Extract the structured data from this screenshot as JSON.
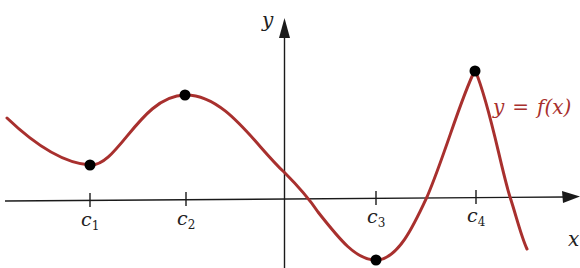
{
  "diagram": {
    "type": "function-graph",
    "axes": {
      "x_label": "x",
      "y_label": "y"
    },
    "function_label": "y = f(x)",
    "function_label_parts": {
      "y": "y",
      "eq": "=",
      "f": "f(x)"
    },
    "colors": {
      "curve": "#a8302e",
      "axis": "#1a1a1a",
      "points": "#000000",
      "function_label": "#a8302e"
    },
    "ticks": [
      {
        "name": "c",
        "sub": "1",
        "x": 90
      },
      {
        "name": "c",
        "sub": "2",
        "x": 186
      },
      {
        "name": "c",
        "sub": "3",
        "x": 376
      },
      {
        "name": "c",
        "sub": "4",
        "x": 476
      }
    ],
    "marked_points": [
      {
        "label": "(c1, f(c1))",
        "kind": "local minimum",
        "px": [
          90,
          165
        ]
      },
      {
        "label": "(c2, f(c2))",
        "kind": "local maximum",
        "px": [
          185,
          95
        ]
      },
      {
        "label": "(c3, f(c3))",
        "kind": "local minimum",
        "px": [
          376,
          260
        ]
      },
      {
        "label": "(c4, f(c4))",
        "kind": "local maximum (cusp)",
        "px": [
          475,
          70
        ]
      }
    ]
  }
}
